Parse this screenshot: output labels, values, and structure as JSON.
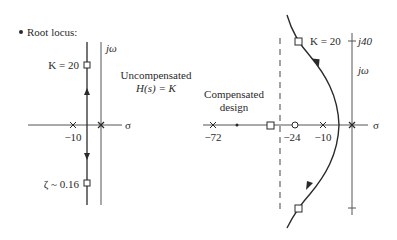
{
  "heading": {
    "bullet": "•",
    "title": "Root locus:"
  },
  "left_plot": {
    "axis_imag_label": "jω",
    "axis_real_label": "σ",
    "gain_label": "K = 20",
    "damping_label": "ζ ~ 0.16",
    "pole_label": "−10",
    "title_line1": "Uncompensated",
    "title_line2": "H(s) = K"
  },
  "right_plot": {
    "axis_imag_label": "jω",
    "axis_real_label": "σ",
    "imag_tick_label": "j40",
    "gain_label": "K = 20",
    "pole_labels": [
      "−72",
      "−10"
    ],
    "zero_label": "−24",
    "title_line1": "Compensated",
    "title_line2": "design"
  },
  "colors": {
    "line": "#2a2a2a",
    "axis": "#555555",
    "background": "#ffffff"
  }
}
